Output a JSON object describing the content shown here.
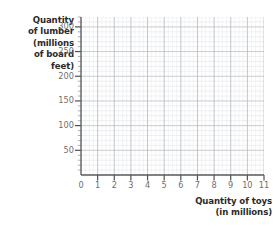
{
  "chart_data": {
    "type": "scatter",
    "title": "",
    "subtitle": "",
    "xlabel": "Quantity of toys (in millions)",
    "ylabel": "Quantity of lumber (millions of board feet)",
    "xlim": [
      0,
      11
    ],
    "ylim": [
      0,
      320
    ],
    "xticks": [
      0,
      1,
      2,
      3,
      4,
      5,
      6,
      7,
      8,
      9,
      10,
      11
    ],
    "yticks": [
      50,
      100,
      150,
      200,
      250,
      300
    ],
    "xtick_labels": [
      "0",
      "1",
      "2",
      "3",
      "4",
      "5",
      "6",
      "7",
      "8",
      "9",
      "10",
      "11"
    ],
    "ytick_labels": [
      "50",
      "100",
      "150",
      "200",
      "250",
      "300"
    ],
    "x_minor_step": 0.25,
    "y_minor_step": 10,
    "grid": true,
    "legend": null,
    "series": [],
    "annotations": [],
    "note": "Empty grid; no data points, bars, or curves are plotted."
  },
  "y_axis_title_lines": [
    "Quantity",
    "of lumber",
    "(millions",
    "of board",
    "feet)"
  ],
  "x_axis_title_lines": [
    "Quantity of toys",
    "(in millions)"
  ],
  "colors": {
    "background": "#ffffff",
    "axis_line": "#58595b",
    "major_grid": "#b9bcc2",
    "minor_grid": "#e3e5e9",
    "tick_label": "#6f6f6f",
    "axis_title": "#2b2b2b"
  }
}
